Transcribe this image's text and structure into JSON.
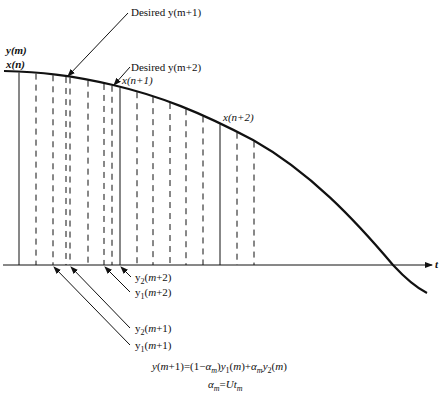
{
  "labels": {
    "y_m": "y(m)",
    "x_n": "x(n)",
    "desired_m1": "Desired y(m+1)",
    "desired_m2": "Desired y(m+2)",
    "x_n1": "x(n+1)",
    "x_n2": "x(n+2)",
    "t_axis": "t",
    "y2_m2": "y2(m+2)",
    "y1_m2": "y1(m+2)",
    "y2_m1": "y2(m+1)",
    "y1_m1": "y1(m+1)"
  },
  "equations": {
    "eq1": "y(m+1)=(1−αm)y1(m)+αmy2(m)",
    "eq2": "αm=Utm"
  },
  "sample_lines": {
    "solid_x": [
      19,
      120,
      220
    ],
    "dashed_x": [
      36,
      53,
      66,
      70,
      88,
      104,
      112,
      137,
      153,
      170,
      186,
      203,
      237,
      254
    ]
  }
}
